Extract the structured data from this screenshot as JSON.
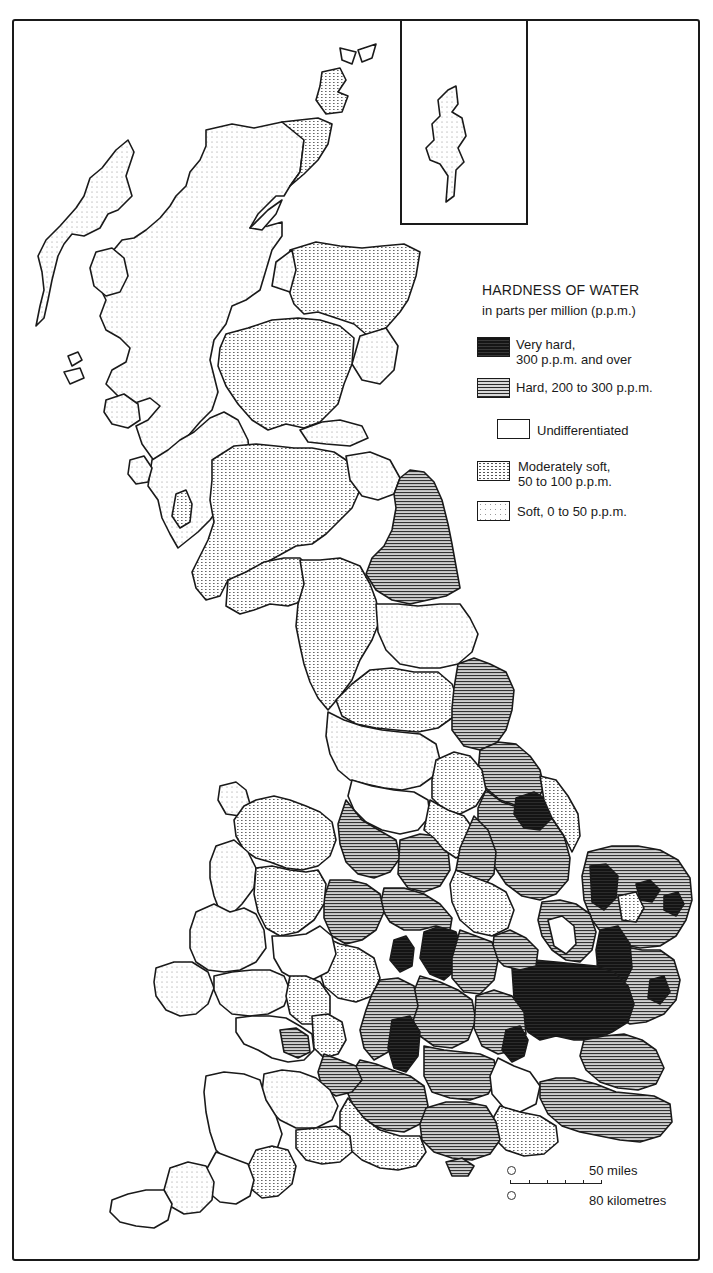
{
  "map": {
    "subject": "Great Britain",
    "inset_label": "Shetland Islands",
    "colors": {
      "very_hard": "#151515",
      "hard": "#8a8a8a",
      "undifferentiated": "#ffffff",
      "moderately_soft": "#f2f2f2",
      "soft": "#fbfbfb",
      "outline": "#1a1a1a"
    }
  },
  "legend": {
    "title": "HARDNESS OF WATER",
    "subtitle": "in parts per million (p.p.m.)",
    "items": [
      {
        "key": "very_hard",
        "line1": "Very hard,",
        "line2": "300 p.p.m. and over"
      },
      {
        "key": "hard",
        "line1": "Hard, 200 to 300 p.p.m.",
        "line2": ""
      },
      {
        "key": "undifferentiated",
        "line1": "Undifferentiated",
        "line2": ""
      },
      {
        "key": "moderately_soft",
        "line1": "Moderately soft,",
        "line2": "50 to 100 p.p.m."
      },
      {
        "key": "soft",
        "line1": "Soft, 0 to 50 p.p.m.",
        "line2": ""
      }
    ]
  },
  "scale": {
    "miles_label": "50 miles",
    "km_label": "80 kilometres",
    "origin_miles": "0",
    "origin_km": "0"
  }
}
